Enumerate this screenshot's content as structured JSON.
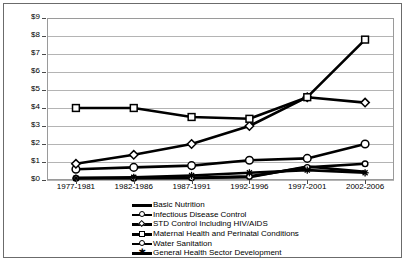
{
  "chart_data": {
    "type": "line",
    "title": "",
    "xlabel": "",
    "ylabel": "",
    "ylim": [
      0,
      9
    ],
    "grid": true,
    "legend_position": "bottom-left",
    "currency_prefix": "$",
    "categories": [
      "1977-1981",
      "1982-1986",
      "1987-1991",
      "1992-1996",
      "1997-2001",
      "2002-2006"
    ],
    "ytick_labels": [
      "$9",
      "$8",
      "$7",
      "$6",
      "$5",
      "$4",
      "$3",
      "$2",
      "$1",
      "$0"
    ],
    "ytick_values": [
      9,
      8,
      7,
      6,
      5,
      4,
      3,
      2,
      1,
      0
    ],
    "series": [
      {
        "name": "Basic Nutrition",
        "marker": "none",
        "values": [
          0.12,
          0.12,
          0.12,
          0.15,
          0.75,
          0.45
        ]
      },
      {
        "name": "Infectious Disease Control",
        "marker": "circle",
        "values": [
          0.6,
          0.7,
          0.8,
          1.1,
          1.2,
          2.0
        ]
      },
      {
        "name": "STD Control Including HIV/AIDS",
        "marker": "diamond",
        "values": [
          0.9,
          1.4,
          2.0,
          3.0,
          4.6,
          4.3
        ]
      },
      {
        "name": "Maternal Health and Perinatal Conditions",
        "marker": "square",
        "values": [
          4.0,
          4.0,
          3.5,
          3.4,
          4.6,
          7.8
        ]
      },
      {
        "name": "Water Sanitation",
        "marker": "circle-small",
        "values": [
          0.1,
          0.1,
          0.12,
          0.2,
          0.7,
          0.9
        ]
      },
      {
        "name": "General Health Sector Development",
        "marker": "star",
        "values": [
          0.1,
          0.15,
          0.25,
          0.4,
          0.55,
          0.4
        ]
      }
    ]
  },
  "colors": {
    "series_line": "#000000",
    "gridline": "#b4b4b4",
    "axis": "#9a9a9a",
    "border": "#6b6b6b",
    "background": "#ffffff",
    "marker_fill": "#ffffff"
  }
}
